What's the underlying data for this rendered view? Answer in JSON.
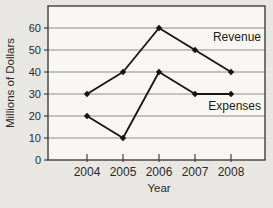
{
  "chart_data": {
    "type": "line",
    "title": "",
    "xlabel": "Year",
    "ylabel": "Millions of Dollars",
    "categories": [
      "2004",
      "2005",
      "2006",
      "2007",
      "2008"
    ],
    "series": [
      {
        "name": "Revenue",
        "values": [
          30,
          40,
          60,
          50,
          40
        ]
      },
      {
        "name": "Expenses",
        "values": [
          20,
          10,
          40,
          30,
          30
        ]
      }
    ],
    "ylim": [
      0,
      70
    ],
    "yticks": [
      0,
      10,
      20,
      30,
      40,
      50,
      60
    ],
    "grid": true,
    "legend_position": "inline-right",
    "marker": "diamond",
    "colors": {
      "line": "#171614",
      "grid": "#8f8d89",
      "axis": "#34322e",
      "plot_bg": "#f8f7f3",
      "page_bg": "#e9e7e3",
      "text": "#2b2927"
    }
  }
}
